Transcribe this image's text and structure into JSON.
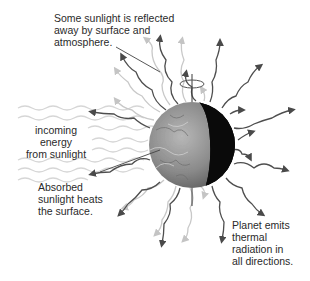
{
  "diagram": {
    "labels": {
      "reflected": "Some sunlight is reflected\naway by surface and\natmosphere.",
      "incoming": "incoming\nenergy\nfrom sunlight",
      "absorbed": "Absorbed\nsunlight heats\nthe surface.",
      "emits": "Planet emits\nthermal\nradiation in\nall directions."
    },
    "elements": {
      "planet": "planet-sphere (day side lit from left, night side dark on right)",
      "incoming_waves": "light wavy lines from left",
      "reflected_rays": "light gray wavy arrows",
      "thermal_rays": "dark gray wavy arrows radiating outward",
      "rotation_axis": "vertical line with rotation arrow"
    },
    "colors": {
      "background": "#ffffff",
      "text": "#2a2a2a",
      "thermal_arrow": "#555555",
      "reflected_arrow": "#c8c8c8",
      "incoming_wave": "#d4d4d4",
      "planet_night": "#0a0a0a",
      "planet_day": "#8a8a8a"
    }
  }
}
